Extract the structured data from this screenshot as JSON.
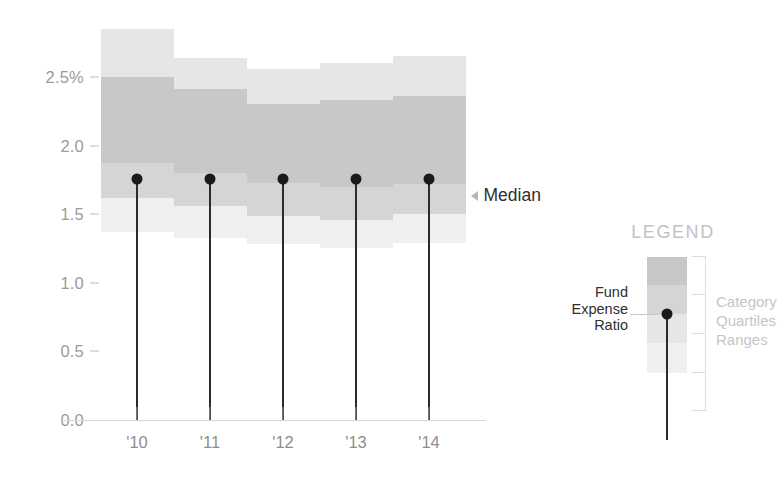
{
  "chart_data": {
    "type": "area",
    "title": "",
    "subtitle": "",
    "xlabel": "",
    "ylabel": "",
    "x": [
      "'10",
      "'11",
      "'12",
      "'13",
      "'14"
    ],
    "categories": [
      "'10",
      "'11",
      "'12",
      "'13",
      "'14"
    ],
    "ylim": [
      0.0,
      2.85
    ],
    "xlim": [
      2009.5,
      2014.5
    ],
    "grid": false,
    "legend_position": "right",
    "y_ticks": [
      {
        "value": 2.5,
        "label": "2.5%"
      },
      {
        "value": 2.0,
        "label": "2.0"
      },
      {
        "value": 1.5,
        "label": "1.5"
      },
      {
        "value": 1.0,
        "label": "1.0"
      },
      {
        "value": 0.5,
        "label": "0.5"
      },
      {
        "value": 0.0,
        "label": "0.0"
      }
    ],
    "x_ticks": [
      {
        "value": 2010,
        "label": "'10"
      },
      {
        "value": 2011,
        "label": "'11"
      },
      {
        "value": 2012,
        "label": "'12"
      },
      {
        "value": 2013,
        "label": "'13"
      },
      {
        "value": 2014,
        "label": "'14"
      }
    ],
    "quartile_boundaries_note": "Stepped category quartile ranges: min, Q1, median, Q3, max",
    "series": [
      {
        "name": "Category Quartiles Ranges",
        "type": "stepped-band",
        "points": [
          {
            "x": "'10",
            "min": 1.37,
            "q1": 1.62,
            "median": 1.87,
            "q3": 2.5,
            "max": 2.85
          },
          {
            "x": "'11",
            "min": 1.33,
            "q1": 1.56,
            "median": 1.8,
            "q3": 2.41,
            "max": 2.64
          },
          {
            "x": "'12",
            "min": 1.28,
            "q1": 1.49,
            "median": 1.73,
            "q3": 2.3,
            "max": 2.56
          },
          {
            "x": "'13",
            "min": 1.25,
            "q1": 1.46,
            "median": 1.7,
            "q3": 2.33,
            "max": 2.6
          },
          {
            "x": "'14",
            "min": 1.29,
            "q1": 1.5,
            "median": 1.72,
            "q3": 2.36,
            "max": 2.65
          }
        ]
      },
      {
        "name": "Fund Expense Ratio",
        "type": "stem-dot",
        "values": [
          1.76,
          1.76,
          1.76,
          1.76,
          1.76
        ]
      }
    ],
    "annotations": [
      {
        "name": "median-pointer",
        "label": "Median",
        "at_y": 1.63,
        "at_x": "'14"
      }
    ],
    "colors": {
      "band_outer": "#d8d8d8",
      "band_upper": "#c8c8c8",
      "band_mid": "#d5d5d5",
      "band_lower": "#e6e6e6",
      "band_inner": "#efefef",
      "stem": "#2b2b2b",
      "dot": "#1a1a1a",
      "axis_text": "#9b9b9b",
      "legend_text": "#c6c6c6"
    }
  },
  "axes": {
    "y_labels": [
      "2.5%",
      "2.0",
      "1.5",
      "1.0",
      "0.5",
      "0.0"
    ],
    "x_labels": [
      "'10",
      "'11",
      "'12",
      "'13",
      "'14"
    ]
  },
  "annotation": {
    "median_label": "Median",
    "median_arrow_icon": "triangle-left-icon"
  },
  "legend": {
    "title": "LEGEND",
    "left_label_line1": "Fund",
    "left_label_line2": "Expense",
    "left_label_line3": "Ratio",
    "right_label_line1": "Category",
    "right_label_line2": "Quartiles",
    "right_label_line3": "Ranges"
  }
}
